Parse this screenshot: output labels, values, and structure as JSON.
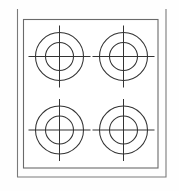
{
  "figure": {
    "canvas": {
      "width": 179,
      "height": 191
    },
    "background_color": "#fefefe",
    "line_color": "#3a3a3a",
    "frame_color": "#6e6e6e"
  },
  "outer_frame": {
    "name": "appliance-outer-edge",
    "x": 17.5,
    "y": 9.0,
    "width": 148.5,
    "height": 168.0,
    "stroke": "#7a7a7a",
    "stroke_width": 1.1,
    "fill": "none",
    "top_edge_visible": false
  },
  "inner_frame": {
    "name": "cooktop-surface-panel",
    "x": 23.5,
    "y": 19.5,
    "width": 134.5,
    "height": 148.5,
    "stroke": "#6a6a6a",
    "stroke_width": 1.1,
    "fill": "#ffffff"
  },
  "burner_geometry": {
    "outer_radius": 24,
    "inner_radius": 14,
    "crosshair_half_length": 31,
    "stroke": "#333333",
    "stroke_width": 1.05
  },
  "burners": [
    {
      "id": "burner-rear-left",
      "label": "Rear Left Burner",
      "cx": 59.5,
      "cy": 56.5,
      "row": 1,
      "col": 1
    },
    {
      "id": "burner-rear-right",
      "label": "Rear Right Burner",
      "cx": 123.5,
      "cy": 56.5,
      "row": 1,
      "col": 2
    },
    {
      "id": "burner-front-left",
      "label": "Front Left Burner",
      "cx": 59.5,
      "cy": 130.0,
      "row": 2,
      "col": 1
    },
    {
      "id": "burner-front-right",
      "label": "Front Right Burner",
      "cx": 123.5,
      "cy": 130.0,
      "row": 2,
      "col": 2
    }
  ],
  "counts": {
    "burner_count": 4,
    "rings_per_burner": 2,
    "crosshair_lines_per_burner": 2
  }
}
